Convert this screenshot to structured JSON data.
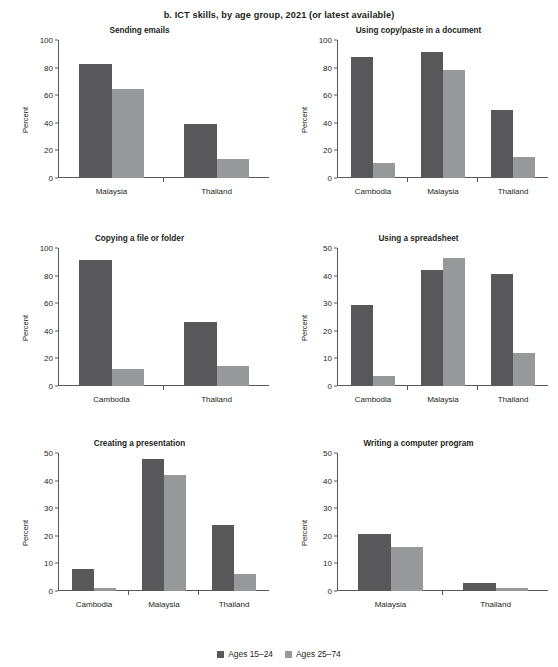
{
  "figure": {
    "title": "b. ICT skills, by age group, 2021 (or latest available)",
    "ylabel": "Percent",
    "colors": {
      "series_young": "#58585a",
      "series_old": "#97989a",
      "axis": "#58585a",
      "text": "#231f20"
    }
  },
  "legend": {
    "position": "bottom-center",
    "entries": [
      {
        "label": "Ages 15–24",
        "color": "#58585a"
      },
      {
        "label": "Ages 25–74",
        "color": "#97989a"
      }
    ]
  },
  "chart_data": [
    {
      "type": "bar",
      "title": "Sending emails",
      "xlabel": "",
      "ylabel": "Percent",
      "categories": [
        "Malaysia",
        "Thailand"
      ],
      "ylim": [
        0,
        100
      ],
      "yticks": [
        0,
        20,
        40,
        60,
        80,
        100
      ],
      "grid": false,
      "series": [
        {
          "name": "Ages 15–24",
          "color": "#58585a",
          "values": [
            82.5,
            39.5
          ]
        },
        {
          "name": "Ages 25–74",
          "color": "#97989a",
          "values": [
            64.5,
            13.5
          ]
        }
      ]
    },
    {
      "type": "bar",
      "title": "Using copy/paste in a document",
      "xlabel": "",
      "ylabel": "Percent",
      "categories": [
        "Cambodia",
        "Malaysia",
        "Thailand"
      ],
      "ylim": [
        0,
        100
      ],
      "yticks": [
        0,
        20,
        40,
        60,
        80,
        100
      ],
      "grid": false,
      "series": [
        {
          "name": "Ages 15–24",
          "color": "#58585a",
          "values": [
            88.0,
            91.0,
            49.0
          ]
        },
        {
          "name": "Ages 25–74",
          "color": "#97989a",
          "values": [
            11.0,
            78.0,
            15.0
          ]
        }
      ]
    },
    {
      "type": "bar",
      "title": "Copying a file or folder",
      "xlabel": "",
      "ylabel": "Percent",
      "categories": [
        "Cambodia",
        "Thailand"
      ],
      "ylim": [
        0,
        100
      ],
      "yticks": [
        0,
        20,
        40,
        60,
        80,
        100
      ],
      "grid": false,
      "series": [
        {
          "name": "Ages 15–24",
          "color": "#58585a",
          "values": [
            91.0,
            46.5
          ]
        },
        {
          "name": "Ages 25–74",
          "color": "#97989a",
          "values": [
            12.0,
            14.5
          ]
        }
      ]
    },
    {
      "type": "bar",
      "title": "Using a spreadsheet",
      "xlabel": "",
      "ylabel": "Percent",
      "categories": [
        "Cambodia",
        "Malaysia",
        "Thailand"
      ],
      "ylim": [
        0,
        50
      ],
      "yticks": [
        0,
        10,
        20,
        30,
        40,
        50
      ],
      "grid": false,
      "series": [
        {
          "name": "Ages 15–24",
          "color": "#58585a",
          "values": [
            29.5,
            42.0,
            40.5
          ]
        },
        {
          "name": "Ages 25–74",
          "color": "#97989a",
          "values": [
            3.7,
            46.5,
            12.0
          ]
        }
      ]
    },
    {
      "type": "bar",
      "title": "Creating a presentation",
      "xlabel": "",
      "ylabel": "Percent",
      "categories": [
        "Cambodia",
        "Malaysia",
        "Thailand"
      ],
      "ylim": [
        0,
        50
      ],
      "yticks": [
        0,
        10,
        20,
        30,
        40,
        50
      ],
      "grid": false,
      "series": [
        {
          "name": "Ages 15–24",
          "color": "#58585a",
          "values": [
            8.0,
            48.0,
            24.0
          ]
        },
        {
          "name": "Ages 25–74",
          "color": "#97989a",
          "values": [
            1.0,
            42.0,
            6.0
          ]
        }
      ]
    },
    {
      "type": "bar",
      "title": "Writing a computer program",
      "xlabel": "",
      "ylabel": "Percent",
      "categories": [
        "Malaysia",
        "Thailand"
      ],
      "ylim": [
        0,
        50
      ],
      "yticks": [
        0,
        10,
        20,
        30,
        40,
        50
      ],
      "grid": false,
      "series": [
        {
          "name": "Ages 15–24",
          "color": "#58585a",
          "values": [
            20.5,
            3.0
          ]
        },
        {
          "name": "Ages 25–74",
          "color": "#97989a",
          "values": [
            16.0,
            1.0
          ]
        }
      ]
    }
  ]
}
